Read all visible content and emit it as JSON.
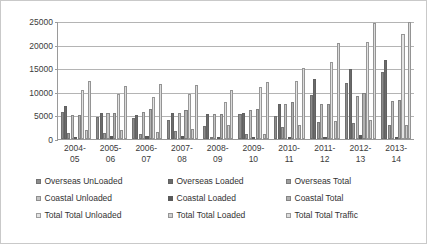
{
  "chart": {
    "type": "bar",
    "title": "",
    "xlabel": "",
    "ylabel": "",
    "border_color": "#c9c9c9",
    "plot_background": "#ffffff"
  },
  "chart_data": {
    "type": "bar",
    "title": "",
    "subtitle": "",
    "xlabel": "",
    "ylabel": "",
    "ylim": [
      0,
      25000
    ],
    "yticks": [
      0,
      5000,
      10000,
      15000,
      20000,
      25000
    ],
    "ytick_labels": [
      "0",
      "5000",
      "10000",
      "15000",
      "20000",
      "25000"
    ],
    "grid": true,
    "legend_position": "bottom",
    "categories": [
      "2004-05",
      "2005-06",
      "2006-07",
      "2007-08",
      "2008-09",
      "2009-10",
      "2010-11",
      "2011-12",
      "2012-13",
      "2013-14"
    ],
    "category_lines": [
      [
        "2004-",
        "05"
      ],
      [
        "2005-",
        "06"
      ],
      [
        "2006-",
        "07"
      ],
      [
        "2007-",
        "08"
      ],
      [
        "2008-",
        "09"
      ],
      [
        "2009-",
        "10"
      ],
      [
        "2010-",
        "11"
      ],
      [
        "2011-",
        "12"
      ],
      [
        "2012-",
        "13"
      ],
      [
        "2013-",
        "14"
      ]
    ],
    "series": [
      {
        "name": "Overseas UnLoaded",
        "color": "#8c8c8c",
        "values": [
          5800,
          4650,
          4500,
          3950,
          2800,
          5200,
          4850,
          9300,
          11800,
          14150
        ]
      },
      {
        "name": "Overseas Loaded",
        "color": "#6b6b6b",
        "values": [
          6950,
          5450,
          5150,
          5500,
          5300,
          5450,
          7350,
          12700,
          14850,
          16750
        ]
      },
      {
        "name": "Overseas Total",
        "color": "#9e9e9e",
        "values": [
          1350,
          1300,
          1150,
          1750,
          500,
          1000,
          2650,
          3500,
          3350,
          2900
        ]
      },
      {
        "name": "Coastal Unloaded",
        "color": "#c4c4c4",
        "values": [
          5150,
          5450,
          5750,
          5500,
          5250,
          6050,
          7500,
          7450,
          9100,
          8050
        ]
      },
      {
        "name": "Coastal Loaded",
        "color": "#5a5a5a",
        "values": [
          500,
          700,
          600,
          650,
          450,
          450,
          450,
          400,
          800,
          450
        ]
      },
      {
        "name": "Coastal Total",
        "color": "#b0b0b0",
        "values": [
          5150,
          5550,
          6300,
          6100,
          5350,
          6450,
          7800,
          7450,
          9650,
          8250
        ]
      },
      {
        "name": "Total Total Unloaded",
        "color": "#e3e3e3",
        "values": [
          10450,
          9450,
          9000,
          9500,
          7800,
          11100,
          12350,
          16400,
          20550,
          22200
        ]
      },
      {
        "name": "Total Total Loaded",
        "color": "#d0d0d0",
        "values": [
          1900,
          1950,
          1400,
          2150,
          3050,
          1100,
          2900,
          3900,
          4000,
          3050
        ]
      },
      {
        "name": "Total Total Traffic",
        "color": "#dcdcdc",
        "values": [
          12200,
          11150,
          11700,
          11350,
          10450,
          12100,
          14950,
          20300,
          24500,
          24850
        ]
      }
    ]
  },
  "legend": {
    "rows": [
      [
        {
          "label": "Overseas UnLoaded",
          "color": "#8c8c8c"
        },
        {
          "label": "Overseas Loaded",
          "color": "#6b6b6b"
        },
        {
          "label": "Overseas Total",
          "color": "#9e9e9e"
        }
      ],
      [
        {
          "label": "Coastal Unloaded",
          "color": "#c4c4c4"
        },
        {
          "label": "Coastal Loaded",
          "color": "#5a5a5a"
        },
        {
          "label": "Coastal Total",
          "color": "#b0b0b0"
        }
      ],
      [
        {
          "label": "Total Total Unloaded",
          "color": "#e3e3e3"
        },
        {
          "label": "Total Total Loaded",
          "color": "#d0d0d0"
        },
        {
          "label": "Total Total Traffic",
          "color": "#dcdcdc"
        }
      ]
    ]
  }
}
